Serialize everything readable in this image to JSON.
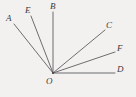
{
  "figure": {
    "kind": "geometry-diagram",
    "background_color": "#f2f1ef",
    "line_color": "#5d5d60",
    "label_color": "#3a3a3d",
    "vertex": {
      "label": "O",
      "x": 53,
      "y": 73,
      "label_x": 46,
      "label_y": 77
    },
    "rays": [
      {
        "name": "ray-OA",
        "label": "A",
        "end_x": 14,
        "end_y": 24,
        "label_x": 6,
        "label_y": 14,
        "angle_deg": 135
      },
      {
        "name": "ray-OE",
        "label": "E",
        "end_x": 31,
        "end_y": 16,
        "label_x": 25,
        "label_y": 6,
        "angle_deg": 116
      },
      {
        "name": "ray-OB",
        "label": "B",
        "end_x": 53,
        "end_y": 12,
        "label_x": 50,
        "label_y": 2,
        "angle_deg": 90
      },
      {
        "name": "ray-OC",
        "label": "C",
        "end_x": 105,
        "end_y": 30,
        "label_x": 106,
        "label_y": 21,
        "angle_deg": 40
      },
      {
        "name": "ray-OF",
        "label": "F",
        "end_x": 115,
        "end_y": 52,
        "label_x": 117,
        "label_y": 44,
        "angle_deg": 22
      },
      {
        "name": "ray-OD",
        "label": "D",
        "end_x": 115,
        "end_y": 73,
        "label_x": 117,
        "label_y": 65,
        "angle_deg": 0
      }
    ]
  }
}
